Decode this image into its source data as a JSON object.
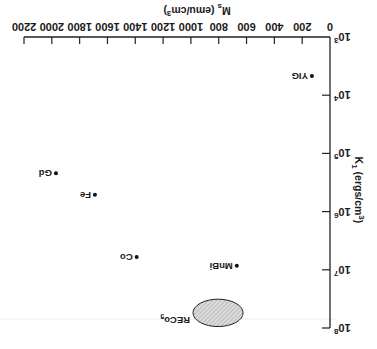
{
  "chart_data": {
    "type": "scatter",
    "title": "",
    "xlabel": "M_s (emu/cm^3)",
    "ylabel": "K_1 (ergs/cm^3)",
    "x_axis": {
      "label_main": "M",
      "label_sub": "s",
      "label_rest": " (emu/cm",
      "label_sup": "3",
      "label_end": ")",
      "range": [
        0,
        2200
      ],
      "ticks": [
        0,
        200,
        400,
        600,
        800,
        1000,
        1200,
        1400,
        1600,
        1800,
        2000,
        2200
      ],
      "tick_labels": [
        "0",
        "200",
        "400",
        "600",
        "800",
        "1000",
        "1200",
        "1400",
        "1600",
        "1800",
        "2000",
        "2200"
      ]
    },
    "y_axis": {
      "label_main": "K",
      "label_sub": "1",
      "label_rest": " (ergs/cm",
      "label_sup": "3",
      "label_end": ")",
      "scale": "log",
      "range": [
        1000,
        100000000
      ],
      "ticks_log10": [
        3,
        4,
        5,
        6,
        7,
        8
      ],
      "tick_labels": [
        {
          "base": "10",
          "exp": "3"
        },
        {
          "base": "10",
          "exp": "4"
        },
        {
          "base": "10",
          "exp": "5"
        },
        {
          "base": "10",
          "exp": "6"
        },
        {
          "base": "10",
          "exp": "7"
        },
        {
          "base": "10",
          "exp": "8"
        }
      ]
    },
    "points": [
      {
        "name": "YIG",
        "x": 130,
        "y_log10": 3.67,
        "y": 4700
      },
      {
        "name": "Gd",
        "x": 1970,
        "y_log10": 5.34,
        "y": 220000
      },
      {
        "name": "Fe",
        "x": 1690,
        "y_log10": 5.71,
        "y": 510000
      },
      {
        "name": "Co",
        "x": 1390,
        "y_log10": 6.78,
        "y": 6000000
      },
      {
        "name": "MnBi",
        "x": 670,
        "y_log10": 6.93,
        "y": 8500000
      }
    ],
    "regions": [
      {
        "name": "RECo",
        "name_sub": "5",
        "shape": "ellipse",
        "x_center": 805,
        "x_range": [
          625,
          985
        ],
        "y_log10_center": 7.74,
        "y_log10_range": [
          7.5,
          7.97
        ],
        "fill": "hatched"
      }
    ],
    "grid": false,
    "legend": null,
    "orientation_note": "image displayed rotated 180 degrees"
  }
}
